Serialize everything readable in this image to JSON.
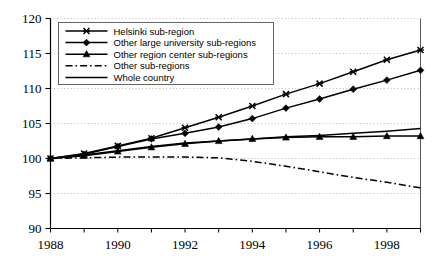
{
  "chart_data": {
    "type": "line",
    "title": "",
    "subtitle": "",
    "xlabel": "",
    "ylabel": "",
    "xlim": [
      1988,
      1999
    ],
    "ylim": [
      90,
      120
    ],
    "yticks": [
      90,
      95,
      100,
      105,
      110,
      115,
      120
    ],
    "ytick_labels": [
      "90",
      "95",
      "100",
      "105",
      "110",
      "115",
      "120"
    ],
    "xticks": [
      1988,
      1990,
      1992,
      1994,
      1996,
      1998
    ],
    "xtick_labels": [
      "1988",
      "1990",
      "1992",
      "1994",
      "1996",
      "1998"
    ],
    "x": [
      1988,
      1989,
      1990,
      1991,
      1992,
      1993,
      1994,
      1995,
      1996,
      1997,
      1998,
      1999
    ],
    "grid": "horizontal-dotted",
    "legend_position": "top-left",
    "series": [
      {
        "name": "Helsinki sub-region",
        "marker": "cross",
        "line_style": "solid",
        "color": "#000000",
        "values": [
          100.0,
          100.7,
          101.8,
          102.9,
          104.4,
          105.9,
          107.5,
          109.2,
          110.7,
          112.4,
          114.1,
          115.5
        ]
      },
      {
        "name": "Other large university sub-regions",
        "marker": "diamond",
        "line_style": "solid",
        "color": "#000000",
        "values": [
          100.0,
          100.6,
          101.7,
          102.8,
          103.6,
          104.5,
          105.7,
          107.2,
          108.5,
          109.9,
          111.2,
          112.6
        ]
      },
      {
        "name": "Other region center sub-regions",
        "marker": "triangle",
        "line_style": "solid",
        "color": "#000000",
        "values": [
          100.0,
          100.4,
          101.0,
          101.6,
          102.1,
          102.5,
          102.8,
          103.0,
          103.1,
          103.1,
          103.2,
          103.2
        ]
      },
      {
        "name": "Other sub-regions",
        "marker": "none",
        "line_style": "dashdot",
        "color": "#000000",
        "values": [
          100.0,
          100.1,
          100.2,
          100.2,
          100.2,
          100.1,
          99.6,
          98.9,
          98.1,
          97.3,
          96.6,
          95.8
        ]
      },
      {
        "name": "Whole country",
        "marker": "none",
        "line_style": "solid",
        "color": "#000000",
        "values": [
          100.0,
          100.5,
          101.1,
          101.7,
          102.2,
          102.5,
          102.8,
          103.1,
          103.3,
          103.6,
          103.9,
          104.3
        ]
      }
    ]
  }
}
